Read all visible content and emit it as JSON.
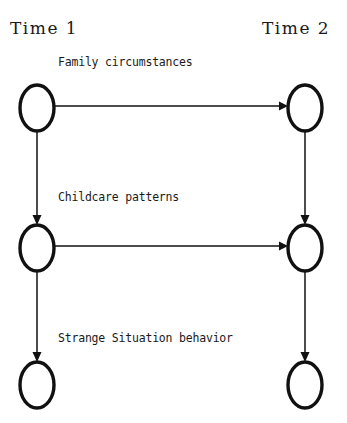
{
  "diagram": {
    "background_color": "#ffffff",
    "stroke_color": "#111111",
    "columns": [
      {
        "id": "time1",
        "header": "Time 1"
      },
      {
        "id": "time2",
        "header": "Time 2"
      }
    ],
    "rows": [
      {
        "id": "family",
        "label": "Family circumstances"
      },
      {
        "id": "childcare",
        "label": "Childcare patterns"
      },
      {
        "id": "strange",
        "label": "Strange Situation behavior"
      }
    ],
    "nodes": [
      {
        "id": "family-t1",
        "row": "family",
        "column": "time1",
        "shape": "ellipse",
        "cx": 37,
        "cy": 108,
        "rx": 17,
        "ry": 23
      },
      {
        "id": "family-t2",
        "row": "family",
        "column": "time2",
        "shape": "ellipse",
        "cx": 305,
        "cy": 108,
        "rx": 17,
        "ry": 23
      },
      {
        "id": "childcare-t1",
        "row": "childcare",
        "column": "time1",
        "shape": "ellipse",
        "cx": 37,
        "cy": 248,
        "rx": 17,
        "ry": 23
      },
      {
        "id": "childcare-t2",
        "row": "childcare",
        "column": "time2",
        "shape": "ellipse",
        "cx": 305,
        "cy": 248,
        "rx": 17,
        "ry": 23
      },
      {
        "id": "strange-t1",
        "row": "strange",
        "column": "time1",
        "shape": "ellipse",
        "cx": 37,
        "cy": 385,
        "rx": 17,
        "ry": 23
      },
      {
        "id": "strange-t2",
        "row": "strange",
        "column": "time2",
        "shape": "ellipse",
        "cx": 305,
        "cy": 385,
        "rx": 17,
        "ry": 23
      }
    ],
    "edges": [
      {
        "id": "family-t1-to-family-t2",
        "from": "family-t1",
        "to": "family-t2",
        "direction": "horizontal"
      },
      {
        "id": "childcare-t1-to-childcare-t2",
        "from": "childcare-t1",
        "to": "childcare-t2",
        "direction": "horizontal"
      },
      {
        "id": "family-t1-to-childcare-t1",
        "from": "family-t1",
        "to": "childcare-t1",
        "direction": "vertical"
      },
      {
        "id": "family-t2-to-childcare-t2",
        "from": "family-t2",
        "to": "childcare-t2",
        "direction": "vertical"
      },
      {
        "id": "childcare-t1-to-strange-t1",
        "from": "childcare-t1",
        "to": "strange-t1",
        "direction": "vertical"
      },
      {
        "id": "childcare-t2-to-strange-t2",
        "from": "childcare-t2",
        "to": "strange-t2",
        "direction": "vertical"
      }
    ],
    "header_positions": [
      {
        "id": "time1",
        "x": 10,
        "y": 34
      },
      {
        "id": "time2",
        "x": 262,
        "y": 34
      }
    ],
    "label_positions": [
      {
        "id": "family",
        "x": 58,
        "y": 66
      },
      {
        "id": "childcare",
        "x": 58,
        "y": 201
      },
      {
        "id": "strange",
        "x": 58,
        "y": 342
      }
    ]
  }
}
